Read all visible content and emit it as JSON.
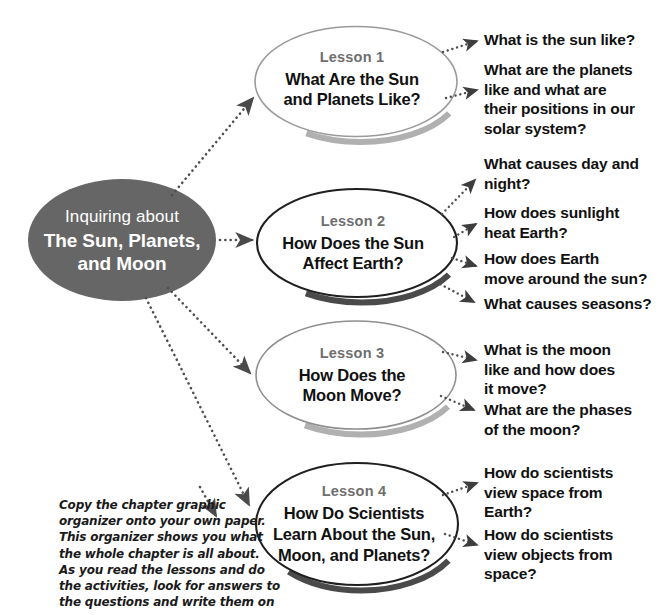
{
  "diagram": {
    "type": "chapter-graphic-organizer",
    "center": {
      "name": "center-node",
      "line1": "Inquiring about",
      "line2": "The Sun, Planets,\nand Moon",
      "line2_lines": [
        "The Sun, Planets,",
        "and Moon"
      ],
      "fill": "#666666",
      "text_color": "#ffffff"
    },
    "lessons": [
      {
        "id": "lesson-1",
        "label": "Lesson 1",
        "title_lines": [
          "What Are the Sun",
          "and Planets Like?"
        ],
        "outline_color": "#9a9a9a",
        "outline_width": 1.6,
        "shadow_color": "#a8a8a8",
        "questions": [
          {
            "id": "q1-1",
            "lines": [
              "What is the sun like?"
            ]
          },
          {
            "id": "q1-2",
            "lines": [
              "What are the planets",
              "like and what are",
              "their positions in our",
              "solar system?"
            ]
          }
        ]
      },
      {
        "id": "lesson-2",
        "label": "Lesson 2",
        "title_lines": [
          "How Does the Sun",
          "Affect Earth?"
        ],
        "outline_color": "#1f1f1f",
        "outline_width": 2.1,
        "shadow_color": "#4a4a4a",
        "questions": [
          {
            "id": "q2-1",
            "lines": [
              "What causes day and",
              "night?"
            ]
          },
          {
            "id": "q2-2",
            "lines": [
              "How does sunlight",
              "heat Earth?"
            ]
          },
          {
            "id": "q2-3",
            "lines": [
              "How does Earth",
              "move around the sun?"
            ]
          },
          {
            "id": "q2-4",
            "lines": [
              "What causes seasons?"
            ]
          }
        ]
      },
      {
        "id": "lesson-3",
        "label": "Lesson 3",
        "title_lines": [
          "How Does the",
          "Moon Move?"
        ],
        "outline_color": "#8f8f8f",
        "outline_width": 1.6,
        "shadow_color": "#a8a8a8",
        "questions": [
          {
            "id": "q3-1",
            "lines": [
              "What is the moon",
              "like and how does",
              "it move?"
            ]
          },
          {
            "id": "q3-2",
            "lines": [
              "What are the phases",
              "of the moon?"
            ]
          }
        ]
      },
      {
        "id": "lesson-4",
        "label": "Lesson 4",
        "title_lines": [
          "How Do Scientists",
          "Learn About the Sun,",
          "Moon, and Planets?"
        ],
        "outline_color": "#1f1f1f",
        "outline_width": 2.1,
        "shadow_color": "#4a4a4a",
        "questions": [
          {
            "id": "q4-1",
            "lines": [
              "How do scientists",
              "view space from",
              "Earth?"
            ]
          },
          {
            "id": "q4-2",
            "lines": [
              "How do scientists",
              "view objects from",
              "space?"
            ]
          }
        ]
      }
    ],
    "caption": {
      "name": "instruction-caption",
      "lines": [
        "Copy the chapter graphic",
        "organizer onto your own paper.",
        "This organizer shows you what",
        "the whole chapter is all about.",
        "As you read the lessons and do",
        "the activities, look for answers to",
        "the questions and write them on"
      ]
    },
    "connector_style": {
      "kind": "dotted-arrow",
      "color": "#4f4f4f"
    }
  }
}
